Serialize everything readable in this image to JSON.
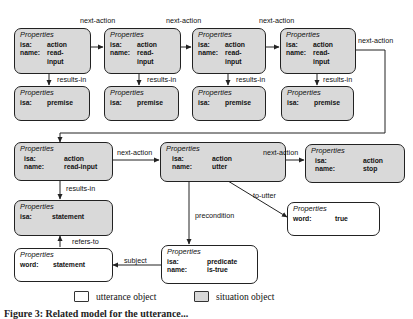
{
  "header_label": "Properties",
  "nodes": {
    "n1": {
      "type": "situation",
      "props": [
        {
          "k": "isa:",
          "v": "action"
        },
        {
          "k": "name:",
          "v": "read-\ninput"
        }
      ]
    },
    "n2": {
      "type": "situation",
      "props": [
        {
          "k": "isa:",
          "v": "action"
        },
        {
          "k": "name:",
          "v": "read-\ninput"
        }
      ]
    },
    "n3": {
      "type": "situation",
      "props": [
        {
          "k": "isa:",
          "v": "action"
        },
        {
          "k": "name:",
          "v": "read-\ninput"
        }
      ]
    },
    "n4": {
      "type": "situation",
      "props": [
        {
          "k": "isa:",
          "v": "action"
        },
        {
          "k": "name:",
          "v": "read-\ninput"
        }
      ]
    },
    "p1": {
      "type": "situation",
      "props": [
        {
          "k": "isa:",
          "v": "premise"
        }
      ]
    },
    "p2": {
      "type": "situation",
      "props": [
        {
          "k": "isa:",
          "v": "premise"
        }
      ]
    },
    "p3": {
      "type": "situation",
      "props": [
        {
          "k": "isa:",
          "v": "premise"
        }
      ]
    },
    "p4": {
      "type": "situation",
      "props": [
        {
          "k": "isa:",
          "v": "premise"
        }
      ]
    },
    "n5": {
      "type": "situation",
      "props": [
        {
          "k": "isa:",
          "v": "action"
        },
        {
          "k": "name:",
          "v": "read-input"
        }
      ]
    },
    "n6": {
      "type": "situation",
      "props": [
        {
          "k": "isa:",
          "v": "action"
        },
        {
          "k": "name:",
          "v": "utter"
        }
      ]
    },
    "n7": {
      "type": "situation",
      "props": [
        {
          "k": "isa:",
          "v": "action"
        },
        {
          "k": "name:",
          "v": "stop"
        }
      ]
    },
    "s1": {
      "type": "situation",
      "props": [
        {
          "k": "isa:",
          "v": "statement"
        }
      ]
    },
    "u1": {
      "type": "utterance",
      "props": [
        {
          "k": "word:",
          "v": "true"
        }
      ]
    },
    "u2": {
      "type": "utterance",
      "props": [
        {
          "k": "word:",
          "v": "statement"
        }
      ]
    },
    "u3": {
      "type": "utterance",
      "props": [
        {
          "k": "isa:",
          "v": "predicate"
        },
        {
          "k": "name:",
          "v": "is-true"
        }
      ]
    }
  },
  "edges": {
    "next_action": "next-action",
    "results_in": "results-in",
    "to_utter": "to-utter",
    "precondition": "precondition",
    "subject": "subject",
    "refers_to": "refers-to"
  },
  "legend": {
    "utterance": "utterance object",
    "situation": "situation object"
  },
  "caption": "Figure 3: Related model for the utterance..."
}
